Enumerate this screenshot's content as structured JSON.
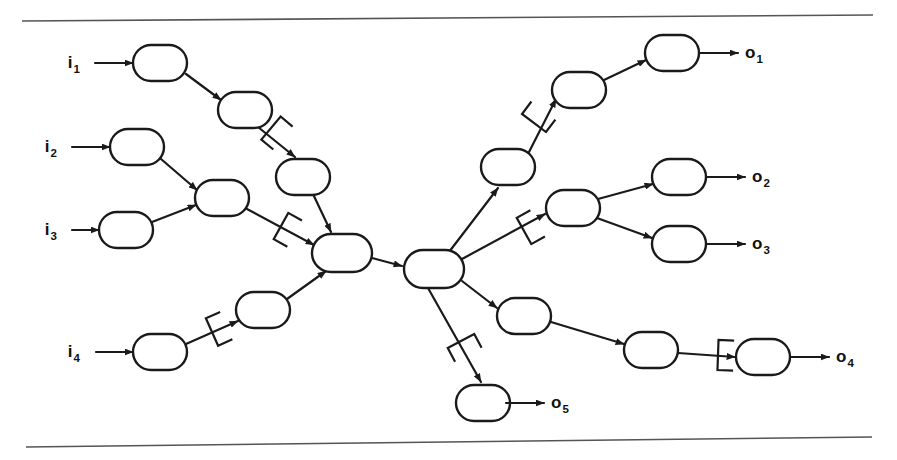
{
  "figure": {
    "type": "network-flow-diagram",
    "background_color": "#ffffff",
    "ink_color": "#1a1a1a",
    "rule_color": "#555555",
    "width": 897,
    "height": 460
  },
  "rules": [
    {
      "name": "top-rule",
      "x1": 22,
      "y1": 21,
      "x2": 873,
      "y2": 15
    },
    {
      "name": "bottom-rule",
      "x1": 26,
      "y1": 447,
      "x2": 872,
      "y2": 437
    }
  ],
  "inputs": [
    {
      "id": "i1",
      "label": "i",
      "sub": "1",
      "label_x": 80,
      "label_y": 68,
      "arrow_x1": 95,
      "arrow_y1": 63,
      "arrow_x2": 133,
      "arrow_y2": 63
    },
    {
      "id": "i2",
      "label": "i",
      "sub": "2",
      "label_x": 57,
      "label_y": 152,
      "arrow_x1": 72,
      "arrow_y1": 147,
      "arrow_x2": 110,
      "arrow_y2": 147
    },
    {
      "id": "i3",
      "label": "i",
      "sub": "3",
      "label_x": 57,
      "label_y": 235,
      "arrow_x1": 72,
      "arrow_y1": 230,
      "arrow_x2": 99,
      "arrow_y2": 230
    },
    {
      "id": "i4",
      "label": "i",
      "sub": "4",
      "label_x": 80,
      "label_y": 357,
      "arrow_x1": 96,
      "arrow_y1": 352,
      "arrow_x2": 133,
      "arrow_y2": 352
    }
  ],
  "outputs": [
    {
      "id": "o1",
      "label": "o",
      "sub": "1",
      "label_x": 745,
      "label_y": 58,
      "arrow_x1": 700,
      "arrow_y1": 53,
      "arrow_x2": 738,
      "arrow_y2": 53
    },
    {
      "id": "o2",
      "label": "o",
      "sub": "2",
      "label_x": 752,
      "label_y": 182,
      "arrow_x1": 707,
      "arrow_y1": 177,
      "arrow_x2": 745,
      "arrow_y2": 177
    },
    {
      "id": "o3",
      "label": "o",
      "sub": "3",
      "label_x": 752,
      "label_y": 249,
      "arrow_x1": 707,
      "arrow_y1": 244,
      "arrow_x2": 745,
      "arrow_y2": 244
    },
    {
      "id": "o4",
      "label": "o",
      "sub": "4",
      "label_x": 836,
      "label_y": 362,
      "arrow_x1": 791,
      "arrow_y1": 357,
      "arrow_x2": 829,
      "arrow_y2": 357
    },
    {
      "id": "o5",
      "label": "o",
      "sub": "5",
      "label_x": 551,
      "label_y": 408,
      "arrow_x1": 506,
      "arrow_y1": 403,
      "arrow_x2": 544,
      "arrow_y2": 403
    }
  ],
  "nodes": [
    {
      "id": "n1",
      "cx": 160,
      "cy": 63,
      "rx": 27,
      "ry": 18,
      "group": "input-chain-1"
    },
    {
      "id": "n2",
      "cx": 245,
      "cy": 110,
      "rx": 27,
      "ry": 18,
      "group": "input-chain-1"
    },
    {
      "id": "n3",
      "cx": 137,
      "cy": 147,
      "rx": 27,
      "ry": 18,
      "group": "input-chain-2"
    },
    {
      "id": "n4",
      "cx": 126,
      "cy": 230,
      "rx": 27,
      "ry": 18,
      "group": "input-chain-3"
    },
    {
      "id": "n5",
      "cx": 222,
      "cy": 198,
      "rx": 27,
      "ry": 18,
      "group": "input-merge-23"
    },
    {
      "id": "n6",
      "cx": 303,
      "cy": 177,
      "rx": 27,
      "ry": 18,
      "group": "input-chain-1"
    },
    {
      "id": "n7",
      "cx": 342,
      "cy": 253,
      "rx": 30,
      "ry": 19,
      "group": "left-hub"
    },
    {
      "id": "n8",
      "cx": 160,
      "cy": 352,
      "rx": 27,
      "ry": 18,
      "group": "input-chain-4"
    },
    {
      "id": "n9",
      "cx": 263,
      "cy": 310,
      "rx": 27,
      "ry": 18,
      "group": "input-chain-4"
    },
    {
      "id": "n10",
      "cx": 434,
      "cy": 269,
      "rx": 30,
      "ry": 19,
      "group": "center-hub"
    },
    {
      "id": "n11",
      "cx": 508,
      "cy": 167,
      "rx": 27,
      "ry": 18,
      "group": "output-chain-1"
    },
    {
      "id": "n12",
      "cx": 579,
      "cy": 90,
      "rx": 27,
      "ry": 18,
      "group": "output-chain-1"
    },
    {
      "id": "n13",
      "cx": 672,
      "cy": 53,
      "rx": 27,
      "ry": 18,
      "group": "output-chain-1"
    },
    {
      "id": "n14",
      "cx": 573,
      "cy": 208,
      "rx": 27,
      "ry": 18,
      "group": "output-split-23"
    },
    {
      "id": "n15",
      "cx": 679,
      "cy": 177,
      "rx": 27,
      "ry": 18,
      "group": "output-chain-2"
    },
    {
      "id": "n16",
      "cx": 679,
      "cy": 244,
      "rx": 27,
      "ry": 18,
      "group": "output-chain-3"
    },
    {
      "id": "n17",
      "cx": 524,
      "cy": 316,
      "rx": 27,
      "ry": 18,
      "group": "output-chain-4"
    },
    {
      "id": "n18",
      "cx": 651,
      "cy": 350,
      "rx": 27,
      "ry": 18,
      "group": "output-chain-4"
    },
    {
      "id": "n19",
      "cx": 763,
      "cy": 357,
      "rx": 27,
      "ry": 18,
      "group": "output-chain-4"
    },
    {
      "id": "n20",
      "cx": 483,
      "cy": 403,
      "rx": 27,
      "ry": 18,
      "group": "output-chain-5"
    }
  ],
  "edges": [
    {
      "from": "n1",
      "to": "n2",
      "x1": 186,
      "y1": 74,
      "x2": 221,
      "y2": 100,
      "arrow": true
    },
    {
      "from": "n2",
      "to": "n6",
      "x1": 258,
      "y1": 127,
      "x2": 295,
      "y2": 157,
      "arrow": true
    },
    {
      "from": "n3",
      "to": "n5",
      "x1": 161,
      "y1": 159,
      "x2": 197,
      "y2": 190,
      "arrow": true
    },
    {
      "from": "n4",
      "to": "n5",
      "x1": 152,
      "y1": 222,
      "x2": 196,
      "y2": 205,
      "arrow": true
    },
    {
      "from": "n5",
      "to": "n7",
      "x1": 247,
      "y1": 209,
      "x2": 314,
      "y2": 245,
      "arrow": true
    },
    {
      "from": "n6",
      "to": "n7",
      "x1": 313,
      "y1": 194,
      "x2": 331,
      "y2": 232,
      "arrow": true
    },
    {
      "from": "n8",
      "to": "n9",
      "x1": 186,
      "y1": 344,
      "x2": 238,
      "y2": 321,
      "arrow": true
    },
    {
      "from": "n9",
      "to": "n7",
      "x1": 287,
      "y1": 299,
      "x2": 326,
      "y2": 271,
      "arrow": true
    },
    {
      "from": "n7",
      "to": "n10",
      "x1": 372,
      "y1": 258,
      "x2": 402,
      "y2": 266,
      "arrow": true
    },
    {
      "from": "n10",
      "to": "n11",
      "x1": 449,
      "y1": 252,
      "x2": 498,
      "y2": 188,
      "arrow": true
    },
    {
      "from": "n11",
      "to": "n12",
      "x1": 528,
      "y1": 154,
      "x2": 556,
      "y2": 99,
      "arrow": true
    },
    {
      "from": "n12",
      "to": "n13",
      "x1": 604,
      "y1": 80,
      "x2": 646,
      "y2": 60,
      "arrow": true
    },
    {
      "from": "n10",
      "to": "n14",
      "x1": 462,
      "y1": 259,
      "x2": 545,
      "y2": 214,
      "arrow": true
    },
    {
      "from": "n14",
      "to": "n15",
      "x1": 598,
      "y1": 199,
      "x2": 653,
      "y2": 184,
      "arrow": true
    },
    {
      "from": "n14",
      "to": "n16",
      "x1": 597,
      "y1": 218,
      "x2": 652,
      "y2": 238,
      "arrow": true
    },
    {
      "from": "n10",
      "to": "n17",
      "x1": 462,
      "y1": 281,
      "x2": 497,
      "y2": 308,
      "arrow": true
    },
    {
      "from": "n17",
      "to": "n18",
      "x1": 551,
      "y1": 322,
      "x2": 624,
      "y2": 344,
      "arrow": true
    },
    {
      "from": "n18",
      "to": "n19",
      "x1": 678,
      "y1": 353,
      "x2": 735,
      "y2": 357,
      "arrow": true
    },
    {
      "from": "n10",
      "to": "n20",
      "x1": 428,
      "y1": 288,
      "x2": 481,
      "y2": 382,
      "arrow": true
    }
  ],
  "bracket_marks": [
    {
      "name": "bracket-on-n2-n6",
      "cx": 271,
      "cy": 128,
      "angle": 40,
      "size": 30
    },
    {
      "name": "bracket-on-n5-n7",
      "cx": 281,
      "cy": 226,
      "angle": 29,
      "size": 30
    },
    {
      "name": "bracket-on-n8-n9",
      "cx": 212,
      "cy": 332,
      "angle": -24,
      "size": 30
    },
    {
      "name": "bracket-on-n10-n11",
      "cx": 534,
      "cy": 123,
      "angle": -53,
      "size": 30
    },
    {
      "name": "bracket-on-n10-n14",
      "cx": 524,
      "cy": 231,
      "angle": -29,
      "size": 30
    },
    {
      "name": "bracket-on-n10-n20",
      "cx": 461,
      "cy": 341,
      "angle": 62,
      "size": 30
    },
    {
      "name": "bracket-on-n18-n19",
      "cx": 718,
      "cy": 355,
      "angle": 2,
      "size": 30
    }
  ],
  "legend": {
    "node_description": "rounded-rectangle",
    "edge_description": "directed-arrow",
    "mark_description": "bracket-annotation"
  }
}
